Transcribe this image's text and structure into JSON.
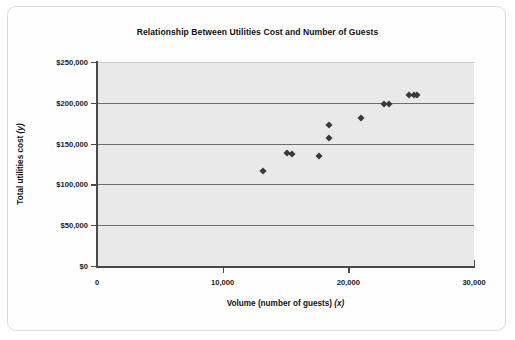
{
  "chart_data": {
    "type": "scatter",
    "title": "Relationship Between Utilities Cost and Number of Guests",
    "xlabel": "Volume (number of guests) (x)",
    "xlabel_text": "Volume (number of guests) ",
    "xlabel_var": "(x)",
    "ylabel": "Total utilities cost (y)",
    "ylabel_text": "Total utilities cost ",
    "ylabel_var": "(y)",
    "xlim": [
      0,
      30000
    ],
    "ylim": [
      0,
      250000
    ],
    "grid": "horizontal",
    "legend": "none",
    "marker": "diamond",
    "marker_color": "#3a3a3a",
    "plot_background": "#e9e9e9",
    "xticks": [
      0,
      10000,
      20000,
      30000
    ],
    "xtick_labels": [
      "0",
      "10,000",
      "20,000",
      "30,000"
    ],
    "yticks": [
      0,
      50000,
      100000,
      150000,
      200000,
      250000
    ],
    "ytick_labels": [
      "$0",
      "$50,000",
      "$100,000",
      "$150,000",
      "$200,000",
      "$250,000"
    ],
    "series": [
      {
        "name": "Utilities cost vs guests",
        "points": [
          {
            "x": 13200,
            "y": 116000
          },
          {
            "x": 15100,
            "y": 139000
          },
          {
            "x": 15500,
            "y": 137000
          },
          {
            "x": 17700,
            "y": 135000
          },
          {
            "x": 18500,
            "y": 157000
          },
          {
            "x": 18500,
            "y": 173000
          },
          {
            "x": 21000,
            "y": 181000
          },
          {
            "x": 22800,
            "y": 199000
          },
          {
            "x": 23200,
            "y": 198000
          },
          {
            "x": 24800,
            "y": 210000
          },
          {
            "x": 25200,
            "y": 209000
          },
          {
            "x": 25500,
            "y": 210000
          }
        ]
      }
    ]
  }
}
